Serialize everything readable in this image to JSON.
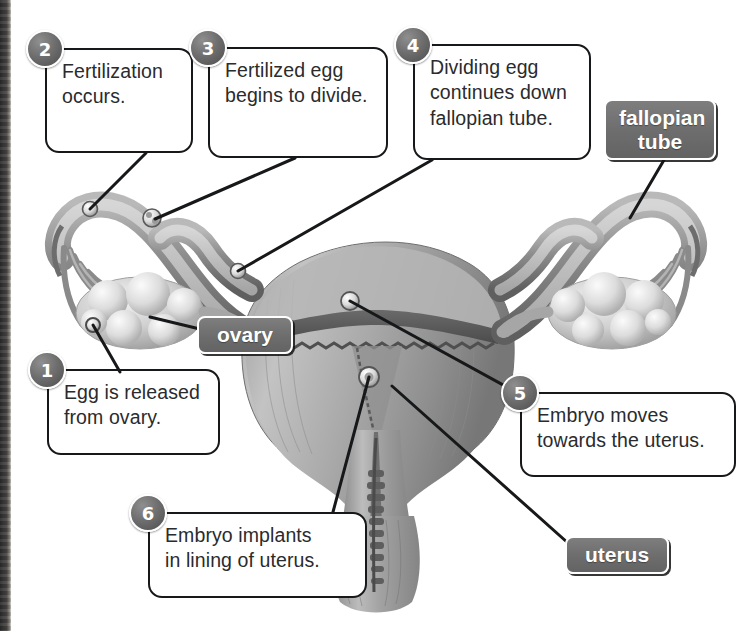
{
  "diagram": {
    "accent_badge_color": "#5e5e5e",
    "tag_color": "#6e6e6e",
    "line_color": "#17181a",
    "steps": [
      {
        "number": "1",
        "lines": [
          "Egg is released",
          "from ovary."
        ]
      },
      {
        "number": "2",
        "lines": [
          "Fertilization",
          "occurs."
        ]
      },
      {
        "number": "3",
        "lines": [
          "Fertilized egg",
          "begins to divide."
        ]
      },
      {
        "number": "4",
        "lines": [
          "Dividing egg",
          "continues down",
          "fallopian tube."
        ]
      },
      {
        "number": "5",
        "lines": [
          "Embryo moves",
          "towards the uterus."
        ]
      },
      {
        "number": "6",
        "lines": [
          "Embryo implants",
          "in lining of uterus."
        ]
      }
    ],
    "tags": [
      {
        "id": "fallopian-tube",
        "lines": [
          "fallopian",
          "tube"
        ]
      },
      {
        "id": "ovary",
        "lines": [
          "ovary"
        ]
      },
      {
        "id": "uterus",
        "lines": [
          "uterus"
        ]
      }
    ]
  }
}
